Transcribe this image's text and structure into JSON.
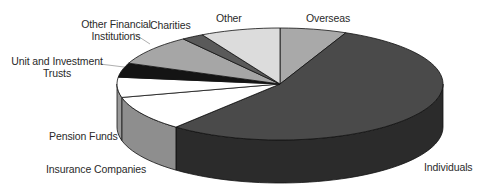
{
  "chart_data": {
    "type": "pie",
    "style": "3d-exploded-none",
    "title": "",
    "start_angle_deg": 0,
    "direction": "clockwise",
    "slices": [
      {
        "label": "Overseas",
        "value": 6.6,
        "top_color": "#a9a9a9",
        "side_color": "#8a8a8a"
      },
      {
        "label": "Individuals",
        "value": 54.3,
        "top_color": "#4a4a4a",
        "side_color": "#2b2b2b"
      },
      {
        "label": "Insurance Companies",
        "value": 10.1,
        "top_color": "#ffffff",
        "side_color": "#8e8e8e"
      },
      {
        "label": "Pension Funds",
        "value": 5.8,
        "top_color": "#ffffff",
        "side_color": "#9a9a9a"
      },
      {
        "label": "Unit and Investment Trusts",
        "value": 4.1,
        "top_color": "#141414",
        "side_color": "#0a0a0a"
      },
      {
        "label": "Other Financial Institutions",
        "value": 8.8,
        "top_color": "#a6a6a6",
        "side_color": "#7f7f7f"
      },
      {
        "label": "Charities",
        "value": 2.2,
        "top_color": "#5a5a5a",
        "side_color": "#3f3f3f"
      },
      {
        "label": "Other",
        "value": 7.9,
        "top_color": "#dcdcdc",
        "side_color": "#b5b5b5"
      }
    ],
    "legend": "none (direct labels with leader lines)",
    "units": "percent (estimated from slice angles)"
  },
  "labels": {
    "overseas": "Overseas",
    "individuals": "Individuals",
    "insurance": "Insurance Companies",
    "pension": "Pension Funds",
    "unit_trusts_line1": "Unit and Investment",
    "unit_trusts_line2": "Trusts",
    "other_fin_line1": "Other Financial",
    "other_fin_line2": "Institutions",
    "charities": "Charities",
    "other": "Other"
  }
}
